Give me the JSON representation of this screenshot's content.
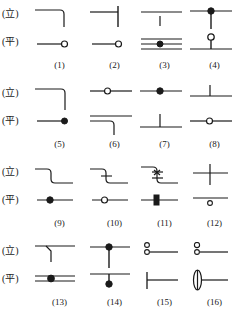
{
  "figure": {
    "type": "engineering-symbol-legend",
    "view_labels": {
      "elevation": "(立)",
      "plan": "(平)"
    },
    "columns_per_row": 4,
    "rows": 4,
    "items": [
      {
        "number": "(1)",
        "elevation": "corner-bend-down-right",
        "plan": "line-with-open-circle-end"
      },
      {
        "number": "(2)",
        "elevation": "tee-vertical-bar-right-of-line",
        "plan": "line-with-open-circle-end"
      },
      {
        "number": "(3)",
        "elevation": "horizontal-line-with-short-stub",
        "plan": "triple-line-with-filled-circle"
      },
      {
        "number": "(4)",
        "elevation": "line-with-filled-circle-and-stem",
        "plan": "line-with-open-circle-and-stem"
      },
      {
        "number": "(5)",
        "elevation": "offset-step-down-right",
        "plan": "line-with-filled-circle-end"
      },
      {
        "number": "(6)",
        "elevation": "line-with-open-circle-midway",
        "plan": "double-line-with-corner-drop"
      },
      {
        "number": "(7)",
        "elevation": "line-with-filled-circle-center",
        "plan": "line-with-vertical-stub-up"
      },
      {
        "number": "(8)",
        "elevation": "line-with-vertical-stub-up",
        "plan": "line-with-open-circle-center"
      },
      {
        "number": "(9)",
        "elevation": "s-bend-step-down",
        "plan": "line-with-filled-circle-center"
      },
      {
        "number": "(10)",
        "elevation": "s-bend-step-down-with-tick",
        "plan": "line-with-open-circle-center"
      },
      {
        "number": "(11)",
        "elevation": "s-bend-with-double-cross-hatch",
        "plan": "line-with-filled-marker-center"
      },
      {
        "number": "(12)",
        "elevation": "cross-plus-junction",
        "plan": "line-with-small-open-circle-below"
      },
      {
        "number": "(13)",
        "elevation": "line-with-short-angled-drop",
        "plan": "double-line-with-filled-circle"
      },
      {
        "number": "(14)",
        "elevation": "line-with-filled-circle-and-stem-down",
        "plan": "line-with-stem-up-to-filled-circle"
      },
      {
        "number": "(15)",
        "elevation": "stacked-open-circles-with-line",
        "plan": "vertical-bar-with-line"
      },
      {
        "number": "(16)",
        "elevation": "stacked-open-circles-with-line",
        "plan": "vertical-ellipse-damper-with-line"
      }
    ]
  },
  "style": {
    "stroke_color": "#1a1a1a",
    "background": "#ffffff"
  }
}
